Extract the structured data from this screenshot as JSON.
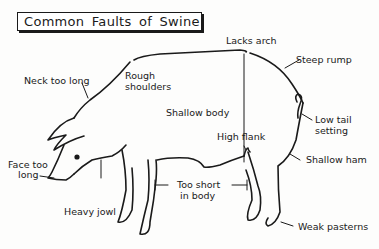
{
  "title": "Common Faults of Swine",
  "labels": {
    "lacks_arch": "Lacks arch",
    "steep_rump": "Steep rump",
    "neck_too_long": "Neck too long",
    "rough_shoulders_1": "Rough",
    "rough_shoulders_2": "shoulders",
    "shallow_body": "Shallow body",
    "low_tail_1": "Low tail",
    "low_tail_2": "setting",
    "high_flank": "High flank",
    "face_too_long_1": "Face too",
    "face_too_long_2": "long",
    "shallow_ham": "Shallow ham",
    "too_short_1": "Too short",
    "too_short_2": "in body",
    "heavy_jowl": "Heavy jowl",
    "weak_pasterns": "Weak pasterns"
  },
  "colors": {
    "ink": "#1a1a1a",
    "paper": "#fdfdfc"
  }
}
